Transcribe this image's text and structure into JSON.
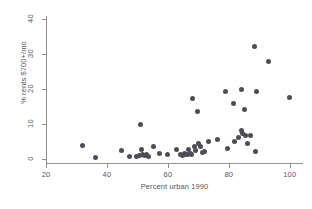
{
  "chart_data": {
    "type": "scatter",
    "title": "",
    "xlabel": "Percent urban 1990",
    "ylabel": "% rents $700+/mo",
    "xlim": [
      20,
      104
    ],
    "ylim": [
      -1.2,
      41
    ],
    "xticks": [
      20,
      40,
      60,
      80,
      100
    ],
    "yticks": [
      0,
      10,
      20,
      30,
      40
    ],
    "xtick_labels": [
      "20",
      "40",
      "60",
      "80",
      "100"
    ],
    "ytick_labels": [
      "0",
      "10",
      "20",
      "30",
      "40"
    ],
    "grid": false,
    "legend": null,
    "marker_color": "#4d4d55",
    "axis_color": "#8f8f96",
    "marker_size": 5,
    "points": [
      {
        "x": 32.0,
        "y": 3.7
      },
      {
        "x": 36.2,
        "y": 0.3
      },
      {
        "x": 44.8,
        "y": 2.5
      },
      {
        "x": 47.4,
        "y": 0.7
      },
      {
        "x": 49.6,
        "y": 0.8
      },
      {
        "x": 50.6,
        "y": 1.0
      },
      {
        "x": 50.9,
        "y": 9.9
      },
      {
        "x": 51.2,
        "y": 2.7
      },
      {
        "x": 51.8,
        "y": 1.2
      },
      {
        "x": 52.4,
        "y": 0.9
      },
      {
        "x": 53.1,
        "y": 1.1
      },
      {
        "x": 53.6,
        "y": 0.6
      },
      {
        "x": 55.2,
        "y": 3.5
      },
      {
        "x": 57.4,
        "y": 1.6
      },
      {
        "x": 59.8,
        "y": 1.1
      },
      {
        "x": 62.9,
        "y": 2.6
      },
      {
        "x": 64.0,
        "y": 1.2
      },
      {
        "x": 64.7,
        "y": 0.9
      },
      {
        "x": 65.3,
        "y": 1.5
      },
      {
        "x": 65.8,
        "y": 1.3
      },
      {
        "x": 66.3,
        "y": 1.1
      },
      {
        "x": 66.9,
        "y": 2.8
      },
      {
        "x": 67.4,
        "y": 1.4
      },
      {
        "x": 67.9,
        "y": 1.2
      },
      {
        "x": 68.2,
        "y": 17.3
      },
      {
        "x": 68.6,
        "y": 3.4
      },
      {
        "x": 69.2,
        "y": 2.4
      },
      {
        "x": 69.6,
        "y": 13.6
      },
      {
        "x": 70.1,
        "y": 4.3
      },
      {
        "x": 70.7,
        "y": 3.6
      },
      {
        "x": 71.3,
        "y": 1.9
      },
      {
        "x": 72.0,
        "y": 2.0
      },
      {
        "x": 73.4,
        "y": 5.1
      },
      {
        "x": 76.2,
        "y": 5.5
      },
      {
        "x": 78.9,
        "y": 19.2
      },
      {
        "x": 79.5,
        "y": 3.0
      },
      {
        "x": 81.6,
        "y": 15.9
      },
      {
        "x": 82.0,
        "y": 4.9
      },
      {
        "x": 83.3,
        "y": 6.2
      },
      {
        "x": 84.1,
        "y": 19.8
      },
      {
        "x": 84.3,
        "y": 8.1
      },
      {
        "x": 84.6,
        "y": 7.4
      },
      {
        "x": 85.0,
        "y": 14.1
      },
      {
        "x": 85.4,
        "y": 6.6
      },
      {
        "x": 86.2,
        "y": 4.4
      },
      {
        "x": 87.1,
        "y": 6.7
      },
      {
        "x": 88.4,
        "y": 32.3
      },
      {
        "x": 88.6,
        "y": 2.0
      },
      {
        "x": 89.2,
        "y": 19.4
      },
      {
        "x": 93.1,
        "y": 27.8
      },
      {
        "x": 100.0,
        "y": 17.6
      }
    ]
  }
}
